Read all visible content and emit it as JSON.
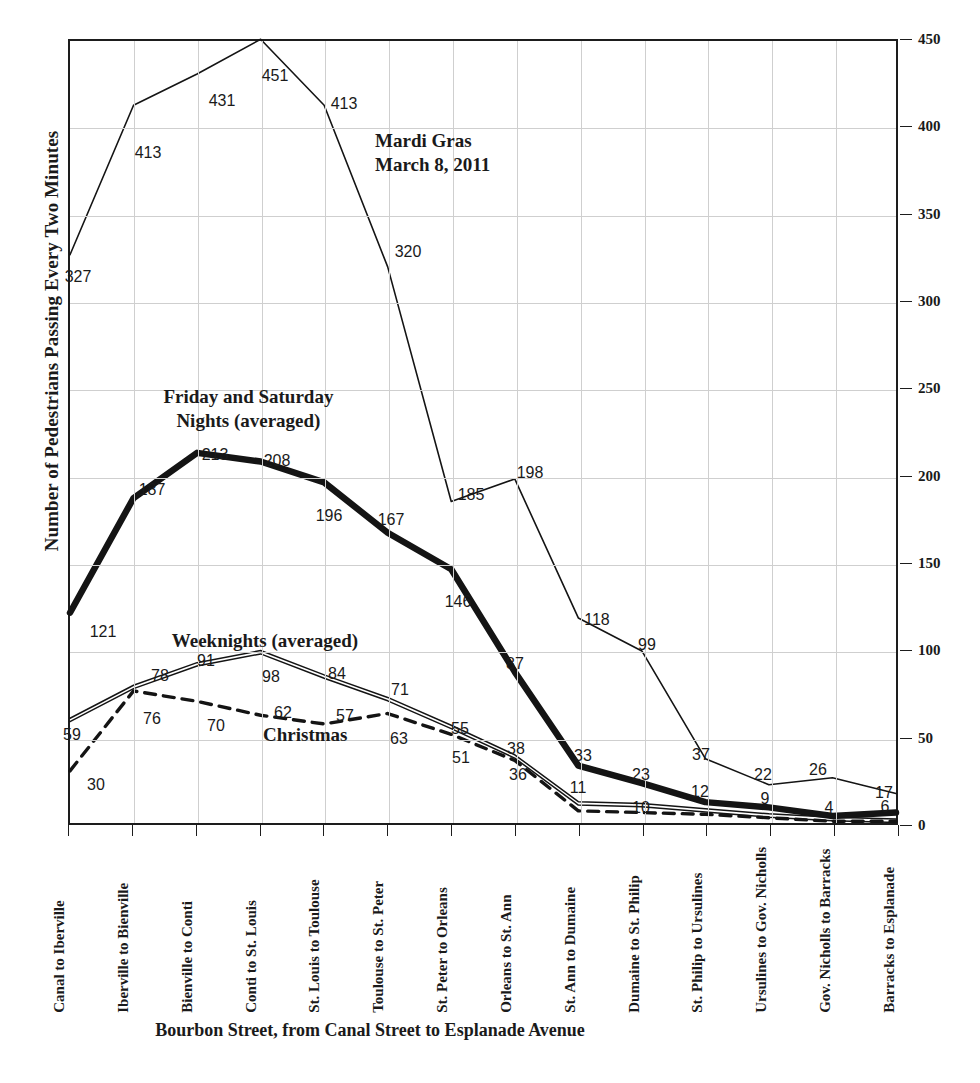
{
  "chart_data": {
    "type": "line",
    "title": "",
    "xlabel": "Bourbon Street, from Canal Street to Esplanade Avenue",
    "ylabel": "Number of Pedestrians Passing Every Two Minutes",
    "ylim": [
      0,
      450
    ],
    "yticks": [
      0,
      50,
      100,
      150,
      200,
      250,
      300,
      350,
      400,
      450
    ],
    "grid": true,
    "legend_position": "in-plot annotations",
    "categories": [
      "Canal to Iberville",
      "Iberville to Bienville",
      "Bienville to Conti",
      "Conti to St. Louis",
      "St. Louis to Toulouse",
      "Toulouse to St. Peter",
      "St. Peter to Orleans",
      "Orleans to St. Ann",
      "St. Ann to Dumaine",
      "Dumaine to St. Philip",
      "St. Philip to Ursulines",
      "Ursulines to Gov. Nicholls",
      "Gov. Nicholls to Barracks",
      "Barracks to Esplanade"
    ],
    "series": [
      {
        "name": "Mardi Gras March 8, 2011",
        "style": "thin-solid",
        "values": [
          327,
          413,
          431,
          451,
          413,
          320,
          185,
          198,
          118,
          99,
          37,
          22,
          26,
          17
        ]
      },
      {
        "name": "Friday and Saturday Nights (averaged)",
        "style": "thick-solid",
        "values": [
          121,
          187,
          213,
          208,
          196,
          167,
          146,
          87,
          33,
          23,
          12,
          9,
          4,
          6
        ]
      },
      {
        "name": "Weeknights (averaged)",
        "style": "double-thin-solid",
        "values": [
          59,
          78,
          91,
          98,
          84,
          71,
          55,
          38,
          11,
          10,
          7,
          4,
          2,
          1
        ]
      },
      {
        "name": "Christmas",
        "style": "dashed",
        "values": [
          30,
          76,
          70,
          62,
          57,
          63,
          51,
          36,
          7,
          6,
          5,
          3,
          1,
          1
        ]
      }
    ],
    "annotations": [
      {
        "text": "Mardi Gras\nMarch 8, 2011",
        "x_pct": 37.0,
        "y_pct": 11.5
      },
      {
        "text": "Friday and Saturday\nNights (averaged)",
        "x_pct": 11.5,
        "y_pct": 44.0
      },
      {
        "text": "Weeknights (averaged)",
        "x_pct": 12.5,
        "y_pct": 75.0
      },
      {
        "text": "Christmas",
        "x_pct": 23.5,
        "y_pct": 87.0
      }
    ],
    "value_labels": [
      {
        "series": 0,
        "text": "327",
        "x": 78,
        "y": 277
      },
      {
        "series": 0,
        "text": "413",
        "x": 148,
        "y": 153
      },
      {
        "series": 0,
        "text": "431",
        "x": 222,
        "y": 101
      },
      {
        "series": 0,
        "text": "451",
        "x": 275,
        "y": 76
      },
      {
        "series": 0,
        "text": "413",
        "x": 344,
        "y": 104
      },
      {
        "series": 0,
        "text": "320",
        "x": 408,
        "y": 252
      },
      {
        "series": 0,
        "text": "185",
        "x": 471,
        "y": 495
      },
      {
        "series": 0,
        "text": "198",
        "x": 530,
        "y": 473
      },
      {
        "series": 0,
        "text": "118",
        "x": 597,
        "y": 620
      },
      {
        "series": 0,
        "text": "99",
        "x": 647,
        "y": 645
      },
      {
        "series": 0,
        "text": "37",
        "x": 701,
        "y": 755
      },
      {
        "series": 0,
        "text": "22",
        "x": 763,
        "y": 775
      },
      {
        "series": 0,
        "text": "26",
        "x": 818,
        "y": 770
      },
      {
        "series": 0,
        "text": "17",
        "x": 884,
        "y": 793
      },
      {
        "series": 1,
        "text": "121",
        "x": 103,
        "y": 632
      },
      {
        "series": 1,
        "text": "187",
        "x": 152,
        "y": 490
      },
      {
        "series": 1,
        "text": "213",
        "x": 215,
        "y": 455
      },
      {
        "series": 1,
        "text": "208",
        "x": 277,
        "y": 461
      },
      {
        "series": 1,
        "text": "196",
        "x": 329,
        "y": 516
      },
      {
        "series": 1,
        "text": "167",
        "x": 391,
        "y": 520
      },
      {
        "series": 1,
        "text": "146",
        "x": 458,
        "y": 602
      },
      {
        "series": 1,
        "text": "87",
        "x": 515,
        "y": 664
      },
      {
        "series": 1,
        "text": "33",
        "x": 583,
        "y": 756
      },
      {
        "series": 1,
        "text": "23",
        "x": 641,
        "y": 775
      },
      {
        "series": 1,
        "text": "12",
        "x": 700,
        "y": 792
      },
      {
        "series": 1,
        "text": "9",
        "x": 765,
        "y": 799
      },
      {
        "series": 1,
        "text": "4",
        "x": 829,
        "y": 808
      },
      {
        "series": 1,
        "text": "6",
        "x": 885,
        "y": 807
      },
      {
        "series": 2,
        "text": "59",
        "x": 72,
        "y": 735
      },
      {
        "series": 2,
        "text": "78",
        "x": 160,
        "y": 676
      },
      {
        "series": 2,
        "text": "91",
        "x": 206,
        "y": 661
      },
      {
        "series": 2,
        "text": "98",
        "x": 271,
        "y": 677
      },
      {
        "series": 2,
        "text": "84",
        "x": 337,
        "y": 674
      },
      {
        "series": 2,
        "text": "71",
        "x": 400,
        "y": 690
      },
      {
        "series": 2,
        "text": "55",
        "x": 460,
        "y": 729
      },
      {
        "series": 2,
        "text": "38",
        "x": 516,
        "y": 749
      },
      {
        "series": 2,
        "text": "11",
        "x": 578,
        "y": 788
      },
      {
        "series": 2,
        "text": "10",
        "x": 641,
        "y": 808
      },
      {
        "series": 3,
        "text": "30",
        "x": 96,
        "y": 785
      },
      {
        "series": 3,
        "text": "76",
        "x": 152,
        "y": 719
      },
      {
        "series": 3,
        "text": "70",
        "x": 216,
        "y": 726
      },
      {
        "series": 3,
        "text": "62",
        "x": 283,
        "y": 713
      },
      {
        "series": 3,
        "text": "57",
        "x": 345,
        "y": 716
      },
      {
        "series": 3,
        "text": "63",
        "x": 399,
        "y": 739
      },
      {
        "series": 3,
        "text": "51",
        "x": 461,
        "y": 758
      },
      {
        "series": 3,
        "text": "36",
        "x": 518,
        "y": 775
      }
    ]
  }
}
